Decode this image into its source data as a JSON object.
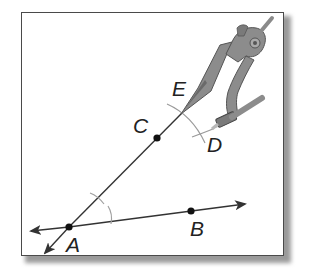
{
  "figure": {
    "points": {
      "A": {
        "label": "A"
      },
      "B": {
        "label": "B"
      },
      "C": {
        "label": "C"
      },
      "D": {
        "label": "D"
      },
      "E": {
        "label": "E"
      }
    },
    "colors": {
      "line": "#333333",
      "arc": "#9a9a9a",
      "compass_body": "#8c8c8c",
      "compass_dark": "#5a5a5a",
      "frame_border": "#4a4a4a",
      "shadow": "#9a9a9a"
    }
  }
}
